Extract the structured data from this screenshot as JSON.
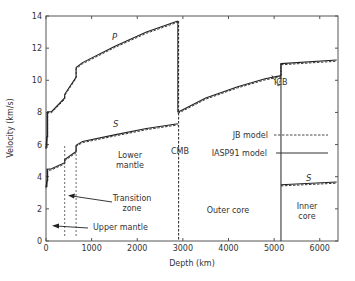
{
  "chart_data": {
    "type": "line",
    "title": "",
    "xlabel": "Depth (km)",
    "ylabel": "Velocity (km/s)",
    "xlim": [
      0,
      6400
    ],
    "ylim": [
      0,
      14
    ],
    "xticks": [
      0,
      1000,
      2000,
      3000,
      4000,
      5000,
      6000
    ],
    "yticks": [
      0,
      2,
      4,
      6,
      8,
      10,
      12,
      14
    ],
    "grid": false,
    "legend": {
      "position": "right-middle",
      "entries": [
        {
          "label": "JB model",
          "style": "dashed"
        },
        {
          "label": "IASP91 model",
          "style": "solid"
        }
      ]
    },
    "series": [
      {
        "name": "P (IASP91)",
        "x": [
          0,
          20,
          35,
          35,
          120,
          410,
          410,
          660,
          660,
          800,
          1500,
          2200,
          2889
        ],
        "values": [
          5.8,
          6.5,
          6.5,
          8.04,
          8.05,
          8.9,
          9.13,
          10.2,
          10.79,
          11.1,
          12.1,
          13.0,
          13.69
        ]
      },
      {
        "name": "P outer core (IASP91)",
        "x": [
          2889,
          3500,
          4200,
          4800,
          5150
        ],
        "values": [
          8.01,
          8.9,
          9.6,
          10.1,
          10.29
        ]
      },
      {
        "name": "P inner core (IASP91)",
        "x": [
          5150,
          6371
        ],
        "values": [
          11.04,
          11.26
        ]
      },
      {
        "name": "S (IASP91)",
        "x": [
          0,
          20,
          35,
          35,
          120,
          410,
          410,
          660,
          660,
          800,
          1500,
          2200,
          2889
        ],
        "values": [
          3.36,
          3.75,
          3.75,
          4.47,
          4.5,
          4.87,
          5.07,
          5.57,
          5.96,
          6.2,
          6.6,
          7.0,
          7.3
        ]
      },
      {
        "name": "S outer core (IASP91)",
        "x": [
          2889,
          5150
        ],
        "values": [
          0,
          0
        ]
      },
      {
        "name": "S inner core (IASP91)",
        "x": [
          5150,
          6371
        ],
        "values": [
          3.5,
          3.67
        ]
      }
    ],
    "annotations": [
      {
        "text": "P",
        "x": 2100,
        "y": 12.6
      },
      {
        "text": "S",
        "x": 1550,
        "y": 7.4
      },
      {
        "text": "S",
        "x": 5900,
        "y": 3.9
      },
      {
        "text": "CMB",
        "x": 2889,
        "y": 7.6
      },
      {
        "text": "ICB",
        "x": 5150,
        "y": 11.7
      },
      {
        "text": "Lower mantle",
        "x": 1900,
        "y": 5.5
      },
      {
        "text": "Transition zone",
        "x": 1400,
        "y": 2.7
      },
      {
        "text": "Upper mantle",
        "x": 1400,
        "y": 0.9
      },
      {
        "text": "Outer core",
        "x": 4000,
        "y": 2.1
      },
      {
        "text": "Inner core",
        "x": 5770,
        "y": 2.0
      }
    ]
  },
  "labels": {
    "xlabel": "Depth (km)",
    "ylabel": "Velocity (km/s)",
    "p": "P",
    "s_mantle": "S",
    "s_inner": "S",
    "cmb": "CMB",
    "icb": "ICB",
    "lower1": "Lower",
    "lower2": "mantle",
    "trans1": "Transition",
    "trans2": "zone",
    "upper": "Upper mantle",
    "outer": "Outer core",
    "inner1": "Inner",
    "inner2": "core",
    "legend_jb": "JB model",
    "legend_iasp": "IASP91 model"
  }
}
